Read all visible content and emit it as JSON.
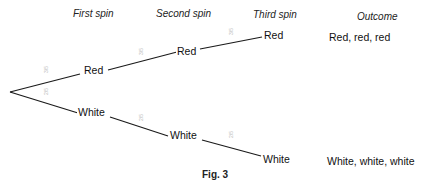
{
  "headers": {
    "first_spin": "First spin",
    "second_spin": "Second spin",
    "third_spin": "Third spin",
    "outcome": "Outcome"
  },
  "nodes": {
    "first_red": "Red",
    "first_white": "White",
    "second_red": "Red",
    "second_white": "White",
    "third_red": "Red",
    "third_white": "White"
  },
  "probabilities": {
    "first_red": "3/5",
    "first_white": "2/5",
    "second_red": "3/5",
    "second_white": "2/5",
    "third_red": "3/5",
    "third_white": "2/5"
  },
  "outcomes": {
    "red_red_red": "Red, red, red",
    "white_white_white": "White, white, white"
  },
  "caption": "Fig. 3",
  "colors": {
    "line": "#1a1a1a",
    "probability_text": "#bbbbbb"
  }
}
